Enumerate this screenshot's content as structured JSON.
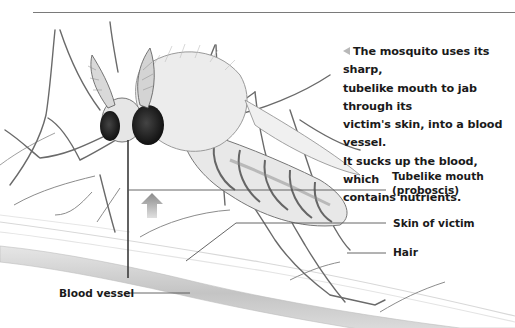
{
  "caption": {
    "marker": "left-triangle-icon",
    "text": "The mosquito uses its sharp, tubelike mouth to jab through its victim's skin, into a blood vessel. It sucks up the blood, which contains nutrients.",
    "lines": [
      "The mosquito uses its sharp,",
      "tubelike mouth to jab through its",
      "victim's skin, into a blood vessel.",
      "It sucks up the blood, which",
      "contains nutrients."
    ]
  },
  "labels": {
    "proboscis_line1": "Tubelike mouth",
    "proboscis_line2": "(proboscis)",
    "skin": "Skin of victim",
    "hair": "Hair",
    "blood_vessel": "Blood vessel"
  },
  "colors": {
    "text": "#1a1a1a",
    "rule": "#7a7a7a",
    "leader": "#555555",
    "arrow": "#8a8a8a",
    "vessel": "#c9c9c9"
  }
}
